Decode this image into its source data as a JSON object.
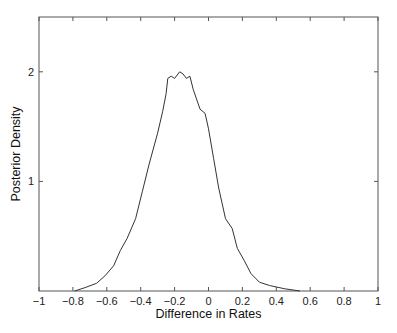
{
  "chart_data": {
    "type": "line",
    "title": "",
    "xlabel": "Difference in Rates",
    "ylabel": "Posterior Density",
    "xlim": [
      -1,
      1
    ],
    "ylim": [
      0,
      2.5
    ],
    "grid": false,
    "legend": null,
    "xticks": [
      -1,
      -0.8,
      -0.6,
      -0.4,
      -0.2,
      0,
      0.2,
      0.4,
      0.6,
      0.8,
      1
    ],
    "xtick_labels": [
      "−1",
      "−0.8",
      "−0.6",
      "−0.4",
      "−0.2",
      "0",
      "0.2",
      "0.4",
      "0.6",
      "0.8",
      "1"
    ],
    "yticks": [
      1,
      2
    ],
    "ytick_labels": [
      "1",
      "2"
    ],
    "series": [
      {
        "name": "posterior density",
        "color": "#333333",
        "x": [
          -0.79,
          -0.73,
          -0.66,
          -0.61,
          -0.56,
          -0.52,
          -0.48,
          -0.43,
          -0.39,
          -0.35,
          -0.3,
          -0.27,
          -0.25,
          -0.24,
          -0.22,
          -0.2,
          -0.17,
          -0.15,
          -0.13,
          -0.11,
          -0.09,
          -0.05,
          -0.02,
          0.0,
          0.03,
          0.06,
          0.1,
          0.14,
          0.17,
          0.21,
          0.25,
          0.3,
          0.36,
          0.45,
          0.54
        ],
        "y": [
          0.0,
          0.03,
          0.07,
          0.14,
          0.23,
          0.37,
          0.48,
          0.66,
          0.91,
          1.16,
          1.44,
          1.64,
          1.8,
          1.94,
          1.96,
          1.94,
          2.0,
          1.98,
          1.94,
          1.96,
          1.84,
          1.66,
          1.62,
          1.48,
          1.21,
          0.94,
          0.66,
          0.57,
          0.39,
          0.28,
          0.16,
          0.08,
          0.05,
          0.02,
          0.0
        ]
      }
    ]
  }
}
